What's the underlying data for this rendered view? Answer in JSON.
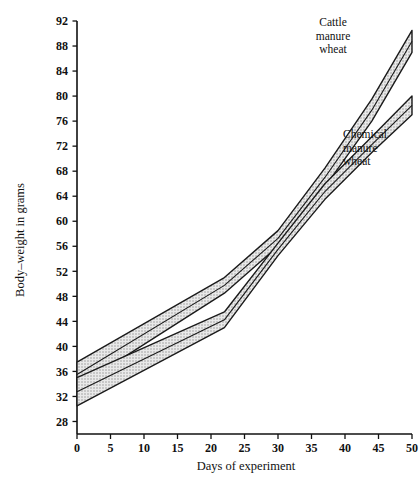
{
  "chart_data": {
    "type": "area",
    "title": "",
    "subtitle": "",
    "xlabel": "Days of experiment",
    "ylabel": "Body–weight in grams",
    "xlim": [
      0,
      50
    ],
    "ylim": [
      26,
      92
    ],
    "grid": false,
    "legend_position": "inline-annotations",
    "xticks": [
      0,
      5,
      10,
      15,
      20,
      25,
      30,
      35,
      40,
      45,
      50
    ],
    "yticks": [
      28,
      32,
      36,
      40,
      44,
      48,
      52,
      56,
      60,
      64,
      68,
      72,
      76,
      80,
      84,
      88,
      92
    ],
    "xtick_labels": [
      "0",
      "5",
      "10",
      "15",
      "20",
      "25",
      "30",
      "35",
      "40",
      "45",
      "50"
    ],
    "ytick_labels": [
      "28",
      "32",
      "36",
      "40",
      "44",
      "48",
      "52",
      "56",
      "60",
      "64",
      "68",
      "72",
      "76",
      "80",
      "84",
      "88",
      "92"
    ],
    "series": [
      {
        "name": "Cattle manure wheat",
        "annotation": "Cattle\nmanure\nwheat",
        "style": "hatched-band",
        "x": [
          0,
          22,
          30,
          37,
          44,
          50
        ],
        "upper": [
          37.5,
          51.0,
          58.5,
          68.5,
          79.5,
          90.5
        ],
        "lower": [
          33.5,
          48.5,
          56.0,
          65.5,
          76.0,
          87.0
        ],
        "center": [
          35.5,
          49.75,
          57.25,
          67.0,
          77.75,
          88.75
        ]
      },
      {
        "name": "Chemical manure wheat",
        "annotation": "Chemical\nmanure\nwheat",
        "style": "hatched-band",
        "x": [
          0,
          22,
          30,
          37,
          44,
          50
        ],
        "upper": [
          35.0,
          45.5,
          56.5,
          66.0,
          73.5,
          80.0
        ],
        "lower": [
          30.5,
          43.0,
          54.5,
          63.5,
          71.0,
          77.0
        ],
        "center": [
          32.75,
          44.25,
          55.5,
          64.75,
          72.25,
          78.5
        ]
      }
    ]
  },
  "annotations": {
    "cattle": "Cattle\nmanure\nwheat",
    "chemical": "Chemical\nmanure\nwheat"
  },
  "axes": {
    "x_title": "Days of experiment",
    "y_title": "Body–weight in grams"
  },
  "colors": {
    "axis": "#111111",
    "band_fill": "#cfcfcf",
    "band_stroke": "#1a1a1a",
    "background": "#ffffff",
    "text": "#111111"
  }
}
